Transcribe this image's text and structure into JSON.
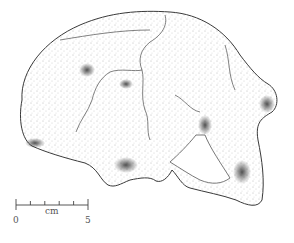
{
  "figure": {
    "ink_color": "#3a3a3a",
    "shade_color": "#555555",
    "background": "#ffffff"
  },
  "scale_bar": {
    "unit_label": "cm",
    "start_label": "0",
    "end_label": "5",
    "ticks": 6
  }
}
